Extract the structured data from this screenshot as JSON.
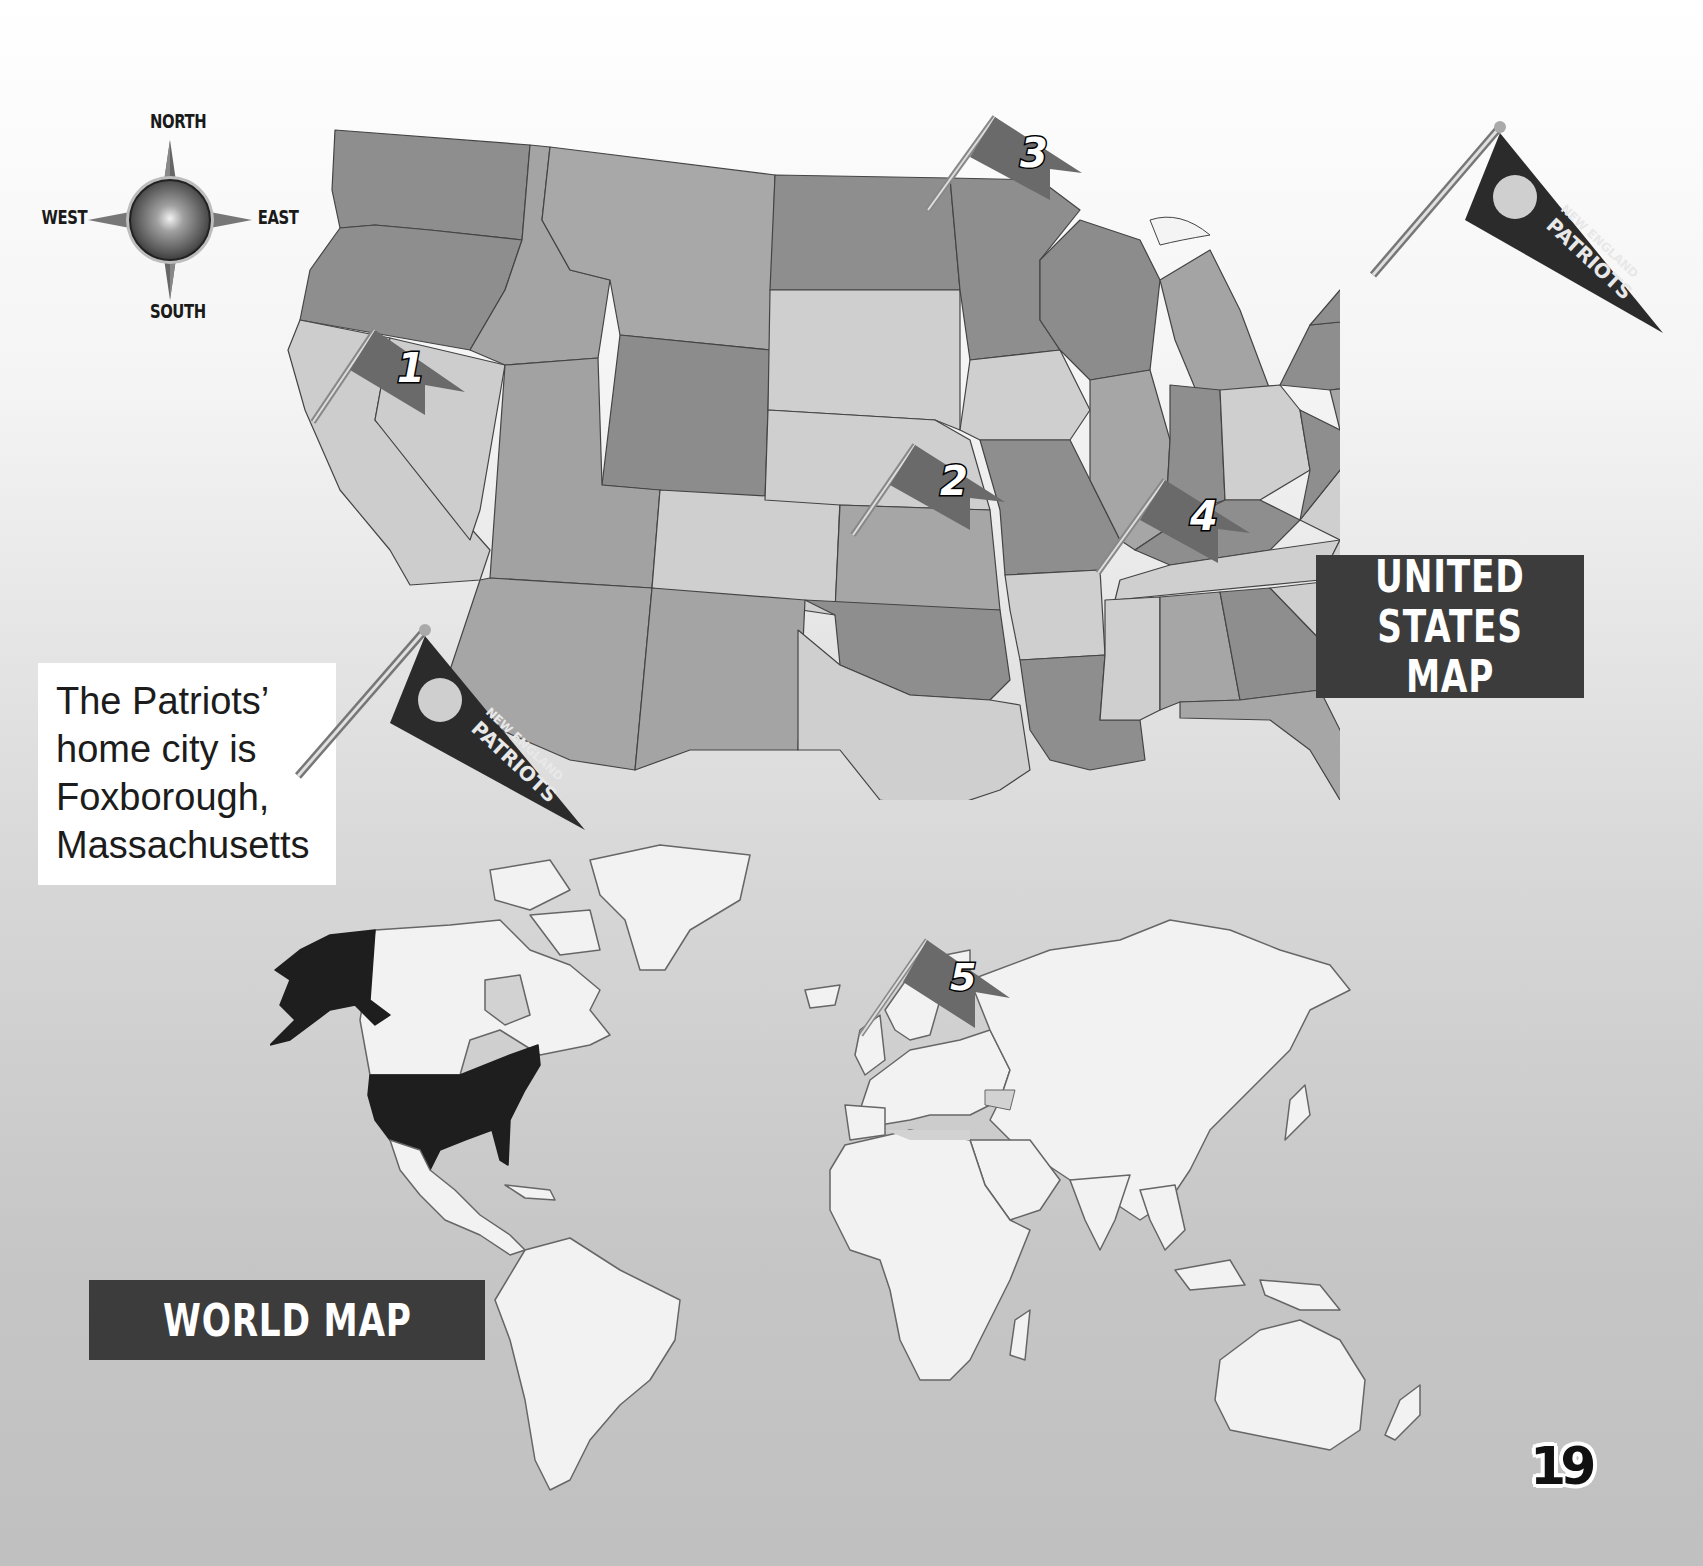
{
  "page": {
    "page_number": "19",
    "background": "#d0d0d0"
  },
  "compass": {
    "north": "NORTH",
    "south": "SOUTH",
    "east": "EAST",
    "west": "WEST"
  },
  "us_map": {
    "title_line1": "UNITED",
    "title_line2": "STATES MAP",
    "state_fill_dark": "#8c8c8c",
    "state_fill_mid": "#a6a6a6",
    "state_fill_light": "#cfcfcf",
    "flags": [
      {
        "number": "1",
        "location": "Northern California / Nevada"
      },
      {
        "number": "2",
        "location": "Oklahoma / Missouri"
      },
      {
        "number": "3",
        "location": "Minnesota"
      },
      {
        "number": "4",
        "location": "Georgia / South Carolina"
      }
    ],
    "pennant": {
      "line1": "NEW ENGLAND",
      "line2": "PATRIOTS",
      "location": "Foxborough, Massachusetts"
    }
  },
  "caption": {
    "line1": "The Patriots’",
    "line2": "home city is",
    "line3": "Foxborough,",
    "line4": "Massachusetts"
  },
  "caption_pennant": {
    "line1": "NEW ENGLAND",
    "line2": "PATRIOTS"
  },
  "world_map": {
    "title": "WORLD MAP",
    "highlight_country": "United States",
    "highlight_color": "#1e1e1e",
    "land_color": "#f2f2f2",
    "flags": [
      {
        "number": "5",
        "location": "Northern Europe / Russia"
      }
    ]
  }
}
